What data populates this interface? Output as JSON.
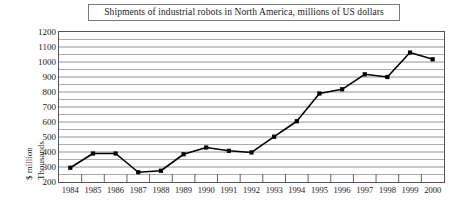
{
  "chart_data": {
    "type": "line",
    "title": "Shipments of industrial robots in North America, millions of US dollars",
    "xlabel": "",
    "ylabel": "$ million\nThousands",
    "ylabel_line1": "$ million",
    "ylabel_line2": "Thousands",
    "categories": [
      "1984",
      "1985",
      "1986",
      "1987",
      "1988",
      "1989",
      "1990",
      "1991",
      "1992",
      "1993",
      "1994",
      "1995",
      "1996",
      "1997",
      "1998",
      "1999",
      "2000"
    ],
    "values": [
      295,
      390,
      390,
      265,
      275,
      385,
      430,
      408,
      397,
      502,
      605,
      790,
      818,
      918,
      900,
      1063,
      1018
    ],
    "series": [
      {
        "name": "Shipments of industrial robots in North America",
        "values": [
          295,
          390,
          390,
          265,
          275,
          385,
          430,
          408,
          397,
          502,
          605,
          790,
          818,
          918,
          900,
          1063,
          1018
        ]
      }
    ],
    "ylim": [
      200,
      1200
    ],
    "y_major_ticks": [
      200,
      300,
      400,
      500,
      600,
      700,
      800,
      900,
      1000,
      1100,
      1200
    ],
    "y_tick_labels": [
      "200",
      "300",
      "400",
      "500",
      "600",
      "700",
      "800",
      "900",
      "1000",
      "1100",
      "1200"
    ],
    "y_gridline_step": 50,
    "grid": true,
    "grid_color": "#888888",
    "legend": false,
    "legend_position": "none",
    "line_color": "#000000",
    "marker": "square",
    "marker_color": "#000000",
    "background_color": "#ffffff",
    "title_border_color": "#7a7a7a",
    "axis_color": "#555555"
  }
}
